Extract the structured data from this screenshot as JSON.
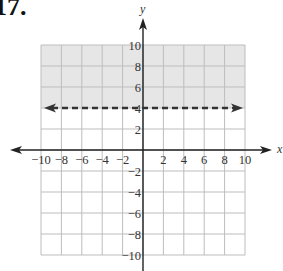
{
  "problem": {
    "label": "17."
  },
  "chart_data": {
    "type": "line",
    "title": "",
    "xlabel": "x",
    "ylabel": "y",
    "xlim": [
      -10,
      10
    ],
    "ylim": [
      -10,
      10
    ],
    "grid": true,
    "grid_step": 2,
    "x_ticks": [
      "-10",
      "-8",
      "-6",
      "-4",
      "-2",
      "2",
      "4",
      "6",
      "8",
      "10"
    ],
    "y_ticks": [
      "10",
      "8",
      "6",
      "4",
      "2",
      "-2",
      "-4",
      "-6",
      "-8",
      "-10"
    ],
    "series": [
      {
        "name": "boundary y = 4",
        "style": "dashed",
        "x": [
          -10,
          10
        ],
        "y": [
          4,
          4
        ],
        "arrows": "both"
      }
    ],
    "shaded_region": {
      "description": "y > 4",
      "from_y": 4,
      "to_y": 10,
      "color": "#e6e6e6"
    },
    "colors": {
      "grid": "#bdbdbd",
      "axis": "#222222",
      "boundary": "#333333",
      "shade": "#e6e6e6"
    }
  }
}
